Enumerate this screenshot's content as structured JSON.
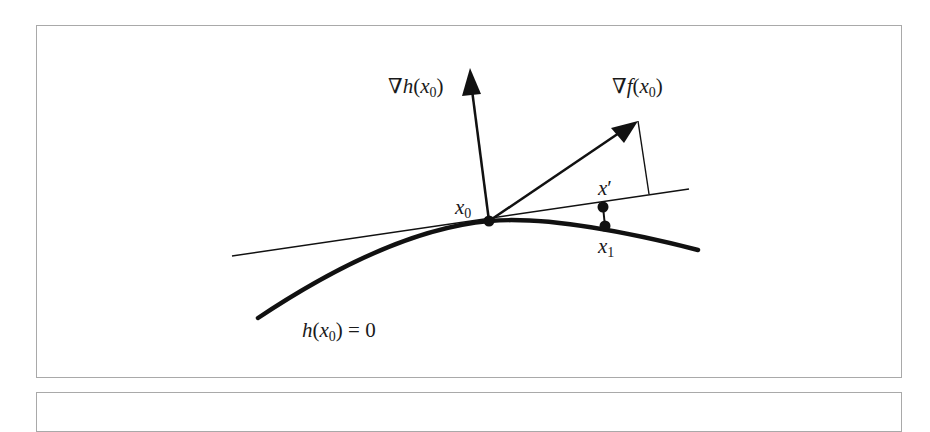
{
  "figure": {
    "labels": {
      "grad_h": {
        "nabla": "∇",
        "fn": "h",
        "open": "(",
        "var": "x",
        "sub": "0",
        "close": ")"
      },
      "grad_f": {
        "nabla": "∇",
        "fn": "f",
        "open": "(",
        "var": "x",
        "sub": "0",
        "close": ")"
      },
      "x0": {
        "var": "x",
        "sub": "0"
      },
      "x_prime": {
        "var": "x",
        "prime": "′"
      },
      "x1": {
        "var": "x",
        "sub": "1"
      },
      "constraint": {
        "fn": "h",
        "open": "(",
        "var": "x",
        "sub": "0",
        "close": ")",
        "rest": " = 0"
      }
    },
    "colors": {
      "stroke": "#111111",
      "border": "#a9a9a9",
      "background": "#ffffff"
    }
  }
}
